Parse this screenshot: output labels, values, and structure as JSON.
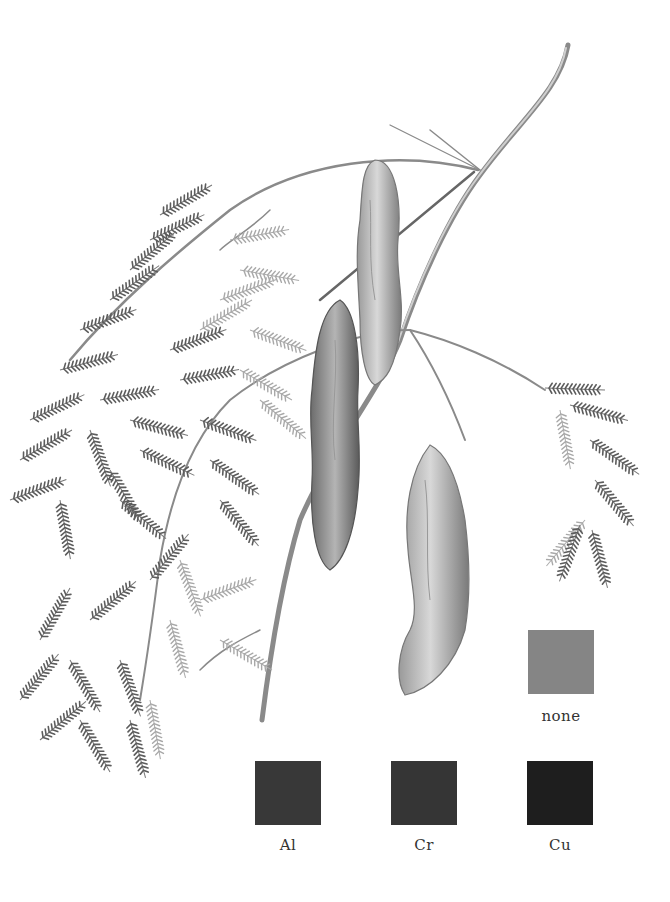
{
  "figure": {
    "background": "#ffffff",
    "stroke_color": "#6a6a6a"
  },
  "swatches": [
    {
      "id": "none",
      "label": "none",
      "color": "#858585",
      "x": 528,
      "y": 630
    },
    {
      "id": "al",
      "label": "Al",
      "color": "#383838",
      "x": 255,
      "y": 761
    },
    {
      "id": "cr",
      "label": "Cr",
      "color": "#353535",
      "x": 391,
      "y": 761
    },
    {
      "id": "cu",
      "label": "Cu",
      "color": "#1e1e1e",
      "x": 527,
      "y": 761
    }
  ]
}
